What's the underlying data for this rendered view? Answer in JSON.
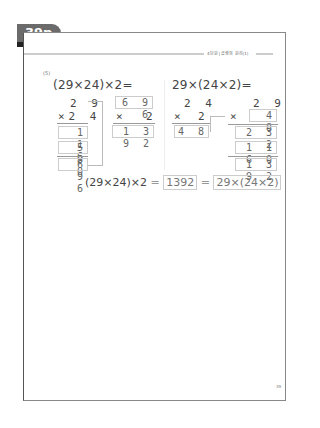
{
  "page_tab": {
    "label": "39p"
  },
  "header": {
    "section_label": "4단원 | 곱셈의 원리(1)"
  },
  "problem": {
    "number": "(5)",
    "left_expression": "(29×24)×2=",
    "right_expression": "29×(24×2)=",
    "left_calc": {
      "step1": {
        "top": "2 9",
        "multiplier": "×2 4",
        "partials": [
          "1 1 6",
          "5 8 0"
        ],
        "result": "6 9 6"
      },
      "step2": {
        "top": "6 9 6",
        "multiplier_sign": "×",
        "multiplier": "2",
        "result": "1 3 9 2"
      }
    },
    "right_calc": {
      "step1": {
        "top": "2 4",
        "multiplier_sign": "×",
        "multiplier": "2",
        "result": "4 8"
      },
      "step2": {
        "top": "2 9",
        "multiplier_sign": "×",
        "multiplier": "4 8",
        "partials": [
          "2 3 2",
          "1 1 6 0"
        ],
        "result": "1 3 9 2"
      }
    },
    "summary": {
      "left": "(29×24)×2",
      "eq1": "=",
      "answer": "1392",
      "eq2": "=",
      "right": "29×(24×2)"
    }
  },
  "footer": {
    "page_number": "39"
  }
}
